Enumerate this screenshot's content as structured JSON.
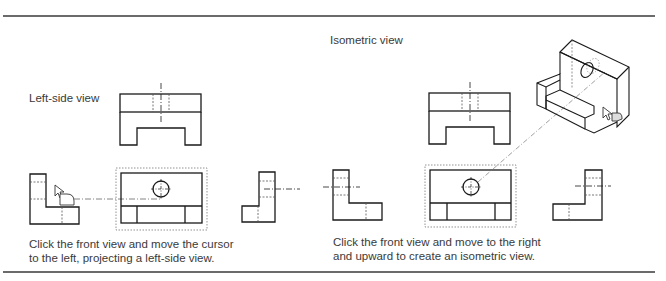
{
  "labels": {
    "left_side_view": "Left-side view",
    "isometric_view": "Isometric view"
  },
  "captions": {
    "left_panel_line1": "Click the front view and move the cursor",
    "left_panel_line2": "to the left, projecting a left-side view.",
    "right_panel_line1": "Click the front view and move to the right",
    "right_panel_line2": "and upward to create an isometric view."
  },
  "colors": {
    "line": "#1a1a1a",
    "hidden_line": "#555555",
    "selection_box": "#777777",
    "rule": "#6b6b6b"
  },
  "icons": [
    "cursor-arrow-icon",
    "drag-handle-icon"
  ]
}
